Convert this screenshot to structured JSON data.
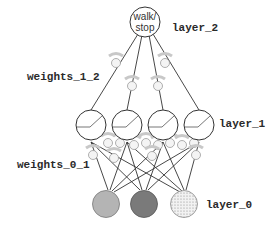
{
  "diagram": {
    "title": "",
    "output_node": {
      "label_line1": "walk/",
      "label_line2": "stop"
    },
    "labels": {
      "layer_2": "layer_2",
      "weights_1_2": "weights_1_2",
      "layer_1": "layer_1",
      "weights_0_1": "weights_0_1",
      "layer_0": "layer_0"
    },
    "layers": [
      {
        "name": "layer_0",
        "nodes": 3,
        "fills": [
          "#b4b4b4",
          "#7a7a7a",
          "dotted-light"
        ]
      },
      {
        "name": "layer_1",
        "nodes": 4,
        "activation": "relu"
      },
      {
        "name": "layer_2",
        "nodes": 1
      }
    ],
    "weights": [
      {
        "name": "weights_0_1",
        "from": "layer_0",
        "to": "layer_1",
        "count": 12,
        "style": "knob"
      },
      {
        "name": "weights_1_2",
        "from": "layer_1",
        "to": "layer_2",
        "count": 4,
        "style": "knob"
      }
    ],
    "colors": {
      "stroke": "#333333",
      "knob": "#c8c8c8",
      "background": "#ffffff"
    }
  }
}
